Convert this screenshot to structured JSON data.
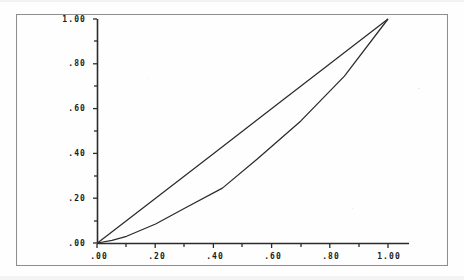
{
  "figure": {
    "kind": "lorenz-curve-plot",
    "background_color": "#fefefe",
    "frame_color": "#8e8e8e",
    "line_color": "#2b2b2b",
    "title": "",
    "subtitle": ""
  },
  "axes": {
    "x": {
      "label": "",
      "tick_labels": [
        ".00",
        ".20",
        ".40",
        ".60",
        ".80",
        "1.00"
      ],
      "tick_values": [
        0.0,
        0.2,
        0.4,
        0.6,
        0.8,
        1.0
      ],
      "range": [
        0.0,
        1.0
      ],
      "minor_ticks": true
    },
    "y": {
      "label": "",
      "tick_labels": [
        ".00",
        ".20",
        ".40",
        ".60",
        ".80",
        "1.00"
      ],
      "tick_values": [
        0.0,
        0.2,
        0.4,
        0.6,
        0.8,
        1.0
      ],
      "range": [
        0.0,
        1.0
      ],
      "minor_ticks": true
    }
  },
  "chart_data": {
    "type": "line",
    "title": "",
    "xlabel": "",
    "ylabel": "",
    "xlim": [
      0.0,
      1.0
    ],
    "ylim": [
      0.0,
      1.0
    ],
    "grid": false,
    "legend": "none",
    "xticks": [
      0.0,
      0.2,
      0.4,
      0.6,
      0.8,
      1.0
    ],
    "xtick_labels": [
      ".00",
      ".20",
      ".40",
      ".60",
      ".80",
      "1.00"
    ],
    "yticks": [
      0.0,
      0.2,
      0.4,
      0.6,
      0.8,
      1.0
    ],
    "ytick_labels": [
      ".00",
      ".20",
      ".40",
      ".60",
      ".80",
      "1.00"
    ],
    "series": [
      {
        "name": "line-of-equality",
        "style": "solid",
        "x": [
          0.0,
          0.2,
          0.4,
          0.6,
          0.8,
          1.0
        ],
        "y": [
          0.0,
          0.2,
          0.4,
          0.6,
          0.8,
          1.0
        ]
      },
      {
        "name": "lorenz-curve",
        "style": "solid",
        "x": [
          0.0,
          0.05,
          0.1,
          0.2,
          0.3,
          0.43,
          0.55,
          0.7,
          0.85,
          1.0
        ],
        "y": [
          0.0,
          0.012,
          0.03,
          0.085,
          0.155,
          0.245,
          0.375,
          0.545,
          0.745,
          1.0
        ]
      }
    ]
  }
}
